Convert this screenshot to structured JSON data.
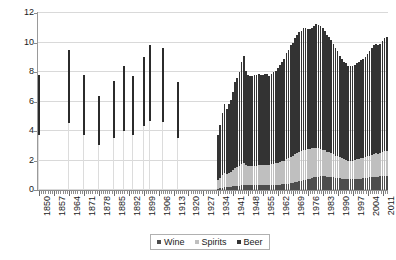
{
  "chart_data": {
    "type": "bar",
    "stacked": true,
    "title": "",
    "subtitle": "",
    "xlabel": "",
    "ylabel": "",
    "ylim": [
      0,
      12
    ],
    "yticks": [
      0,
      2,
      4,
      6,
      8,
      10,
      12
    ],
    "grid": true,
    "legend_position": "bottom-center",
    "legend": [
      "Wine",
      "Spirits",
      "Beer"
    ],
    "colors": {
      "wine": "#4d4d4d",
      "spirits": "#bfbfbf",
      "beer": "#333333",
      "gridline": "#d9d9d9",
      "axis": "#8c8c8c",
      "background": "#ffffff"
    },
    "x_tick_labels": [
      "1850",
      "1857",
      "1964",
      "1871",
      "1878",
      "1885",
      "1892",
      "1899",
      "1906",
      "1913",
      "1920",
      "1927",
      "1934",
      "1941",
      "1948",
      "1955",
      "1962",
      "1969",
      "1976",
      "1983",
      "1990",
      "1997",
      "2004",
      "2011"
    ],
    "x_tick_label_interval": 7,
    "x_start_year": 1850,
    "x_end_year": 2013,
    "note_sparse_period": "1850-1919 sparse single observations; 1920-1933 no data (Prohibition gap); 1934-2013 continuous annual stacked series",
    "sparse_points": [
      {
        "year": 1850,
        "total": 7.8
      },
      {
        "year": 1864,
        "total": 9.5
      },
      {
        "year": 1871,
        "total": 7.8
      },
      {
        "year": 1878,
        "total": 6.4
      },
      {
        "year": 1885,
        "total": 7.4
      },
      {
        "year": 1890,
        "total": 8.4
      },
      {
        "year": 1894,
        "total": 7.7
      },
      {
        "year": 1899,
        "total": 9.0
      },
      {
        "year": 1902,
        "total": 9.8
      },
      {
        "year": 1908,
        "total": 9.6
      },
      {
        "year": 1915,
        "total": 7.3
      }
    ],
    "categories": [
      1934,
      1935,
      1936,
      1937,
      1938,
      1939,
      1940,
      1941,
      1942,
      1943,
      1944,
      1945,
      1946,
      1947,
      1948,
      1949,
      1950,
      1951,
      1952,
      1953,
      1954,
      1955,
      1956,
      1957,
      1958,
      1959,
      1960,
      1961,
      1962,
      1963,
      1964,
      1965,
      1966,
      1967,
      1968,
      1969,
      1970,
      1971,
      1972,
      1973,
      1974,
      1975,
      1976,
      1977,
      1978,
      1979,
      1980,
      1981,
      1982,
      1983,
      1984,
      1985,
      1986,
      1987,
      1988,
      1989,
      1990,
      1991,
      1992,
      1993,
      1994,
      1995,
      1996,
      1997,
      1998,
      1999,
      2000,
      2001,
      2002,
      2003,
      2004,
      2005,
      2006,
      2007,
      2008,
      2009,
      2010,
      2011,
      2012,
      2013
    ],
    "series": [
      {
        "name": "Wine",
        "color": "#4d4d4d",
        "values": [
          0.1,
          0.12,
          0.15,
          0.18,
          0.18,
          0.2,
          0.22,
          0.24,
          0.26,
          0.28,
          0.3,
          0.34,
          0.36,
          0.34,
          0.34,
          0.34,
          0.34,
          0.34,
          0.34,
          0.34,
          0.34,
          0.34,
          0.34,
          0.34,
          0.34,
          0.35,
          0.35,
          0.36,
          0.36,
          0.37,
          0.38,
          0.4,
          0.42,
          0.44,
          0.46,
          0.48,
          0.52,
          0.56,
          0.6,
          0.64,
          0.68,
          0.7,
          0.74,
          0.78,
          0.82,
          0.86,
          0.88,
          0.9,
          0.92,
          0.92,
          0.92,
          0.9,
          0.9,
          0.88,
          0.86,
          0.84,
          0.82,
          0.8,
          0.78,
          0.76,
          0.74,
          0.72,
          0.72,
          0.72,
          0.74,
          0.76,
          0.78,
          0.78,
          0.8,
          0.82,
          0.84,
          0.86,
          0.88,
          0.9,
          0.9,
          0.9,
          0.92,
          0.94,
          0.96,
          0.96
        ]
      },
      {
        "name": "Spirits",
        "color": "#bfbfbf",
        "values": [
          0.55,
          0.7,
          0.85,
          0.95,
          0.9,
          0.95,
          1.0,
          1.1,
          1.25,
          1.3,
          1.35,
          1.45,
          1.5,
          1.35,
          1.3,
          1.3,
          1.3,
          1.3,
          1.3,
          1.35,
          1.35,
          1.35,
          1.38,
          1.38,
          1.35,
          1.4,
          1.42,
          1.44,
          1.48,
          1.52,
          1.56,
          1.6,
          1.68,
          1.72,
          1.8,
          1.85,
          1.92,
          1.96,
          2.0,
          2.02,
          2.05,
          2.04,
          2.02,
          2.0,
          2.0,
          2.0,
          1.98,
          1.94,
          1.88,
          1.82,
          1.78,
          1.7,
          1.66,
          1.62,
          1.56,
          1.5,
          1.46,
          1.42,
          1.38,
          1.34,
          1.32,
          1.28,
          1.28,
          1.28,
          1.3,
          1.32,
          1.34,
          1.36,
          1.38,
          1.4,
          1.44,
          1.48,
          1.52,
          1.56,
          1.58,
          1.56,
          1.58,
          1.62,
          1.66,
          1.68
        ]
      },
      {
        "name": "Beer",
        "color": "#333333",
        "values": [
          3.05,
          3.58,
          4.2,
          4.67,
          4.42,
          4.65,
          4.88,
          5.32,
          5.79,
          6.02,
          6.35,
          6.91,
          7.24,
          6.41,
          6.16,
          6.06,
          6.06,
          6.16,
          6.16,
          6.21,
          6.11,
          6.11,
          6.18,
          6.18,
          6.01,
          6.15,
          6.23,
          6.3,
          6.46,
          6.61,
          6.76,
          6.9,
          7.2,
          7.34,
          7.54,
          7.67,
          7.86,
          7.98,
          8.1,
          8.14,
          8.27,
          8.26,
          8.14,
          8.12,
          8.18,
          8.24,
          8.4,
          8.36,
          8.3,
          8.26,
          8.1,
          7.9,
          7.84,
          7.7,
          7.48,
          7.26,
          7.12,
          6.88,
          6.74,
          6.6,
          6.54,
          6.4,
          6.4,
          6.4,
          6.46,
          6.52,
          6.58,
          6.66,
          6.72,
          6.78,
          6.92,
          7.06,
          7.2,
          7.34,
          7.42,
          7.34,
          7.4,
          7.54,
          7.68,
          7.76
        ]
      }
    ]
  },
  "legend": {
    "items": [
      {
        "label": "Wine",
        "color": "#4d4d4d"
      },
      {
        "label": "Spirits",
        "color": "#bfbfbf"
      },
      {
        "label": "Beer",
        "color": "#333333"
      }
    ]
  }
}
